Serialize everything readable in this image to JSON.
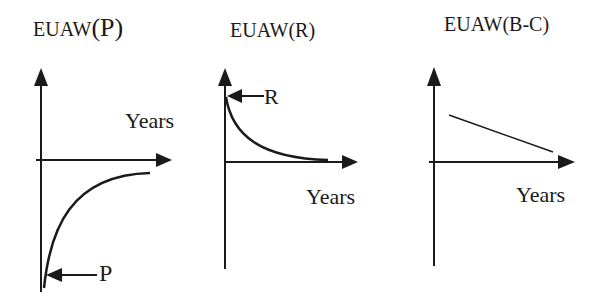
{
  "figure": {
    "panels": [
      {
        "id": "P",
        "title_prefix": "EUAW",
        "title_paren": "(P)",
        "x_axis_label": "Years",
        "pointer_label": "P",
        "description": "Concave curve rising from a large negative value at year 0 toward zero asymptotically"
      },
      {
        "id": "R",
        "title": "EUAW(R)",
        "x_axis_label": "Years",
        "pointer_label": "R",
        "description": "Convex curve decaying from positive value R at year 0 toward zero"
      },
      {
        "id": "B-C",
        "title": "EUAW(B-C)",
        "x_axis_label": "Years",
        "description": "Straight line decreasing linearly, remaining positive"
      }
    ],
    "colors": {
      "ink": "#1a1a1a",
      "background": "#ffffff"
    }
  }
}
